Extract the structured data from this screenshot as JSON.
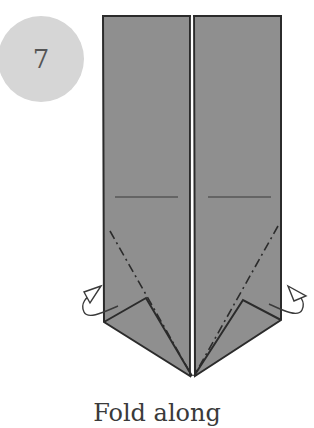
{
  "step": {
    "number": "7",
    "badge_color": "#d6d6d6"
  },
  "diagram": {
    "paper_color": "#8f8f8f",
    "line_color": "#2b2b2b"
  },
  "caption": {
    "text": "Fold along"
  }
}
